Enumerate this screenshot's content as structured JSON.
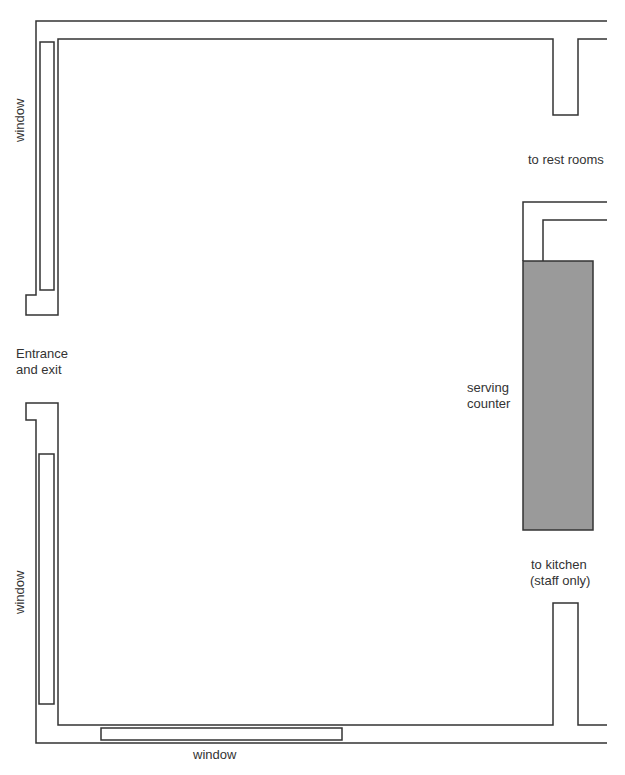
{
  "diagram": {
    "type": "floor-plan",
    "colors": {
      "wall_stroke": "#333333",
      "counter_fill": "#9a9a9a",
      "background": "#ffffff"
    },
    "labels": {
      "window_left_top": "window",
      "window_left_bottom": "window",
      "window_bottom": "window",
      "entrance_line1": "Entrance",
      "entrance_line2": "and exit",
      "rest_rooms": "to rest rooms",
      "counter_line1": "serving",
      "counter_line2": "counter",
      "kitchen_line1": "to kitchen",
      "kitchen_line2": "(staff only)"
    },
    "elements": [
      {
        "name": "left-top-window",
        "label": "window"
      },
      {
        "name": "left-bottom-window",
        "label": "window"
      },
      {
        "name": "bottom-window",
        "label": "window"
      },
      {
        "name": "entrance-opening",
        "label": "Entrance and exit"
      },
      {
        "name": "rest-rooms-opening",
        "label": "to rest rooms"
      },
      {
        "name": "serving-counter",
        "label": "serving counter"
      },
      {
        "name": "kitchen-opening",
        "label": "to kitchen (staff only)"
      }
    ]
  }
}
